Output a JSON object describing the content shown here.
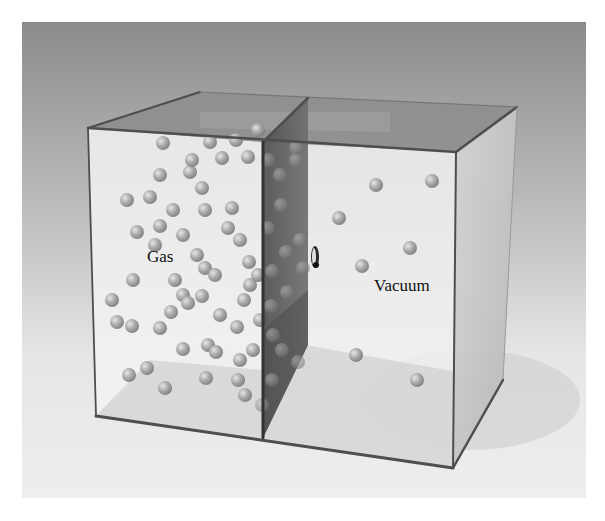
{
  "figure": {
    "labels": {
      "left_chamber": "Gas",
      "right_chamber": "Vacuum"
    },
    "colors": {
      "background_top": "#8c8c8c",
      "background_bottom": "#ededed",
      "particle": "#a8a8a8",
      "partition": "#5e5e5e",
      "glass_edge": "#555555"
    },
    "left_particles": [
      [
        163,
        143
      ],
      [
        127,
        200
      ],
      [
        160,
        175
      ],
      [
        190,
        172
      ],
      [
        202,
        188
      ],
      [
        222,
        158
      ],
      [
        248,
        157
      ],
      [
        192,
        160
      ],
      [
        160,
        226
      ],
      [
        150,
        197
      ],
      [
        137,
        232
      ],
      [
        183,
        235
      ],
      [
        205,
        210
      ],
      [
        232,
        208
      ],
      [
        173,
        210
      ],
      [
        197,
        255
      ],
      [
        205,
        268
      ],
      [
        175,
        280
      ],
      [
        155,
        245
      ],
      [
        240,
        240
      ],
      [
        249,
        262
      ],
      [
        228,
        228
      ],
      [
        215,
        275
      ],
      [
        250,
        285
      ],
      [
        133,
        280
      ],
      [
        183,
        295
      ],
      [
        202,
        296
      ],
      [
        171,
        312
      ],
      [
        132,
        326
      ],
      [
        160,
        328
      ],
      [
        188,
        303
      ],
      [
        220,
        315
      ],
      [
        244,
        300
      ],
      [
        237,
        327
      ],
      [
        253,
        350
      ],
      [
        147,
        368
      ],
      [
        208,
        345
      ],
      [
        216,
        352
      ],
      [
        183,
        349
      ],
      [
        240,
        360
      ],
      [
        129,
        375
      ],
      [
        165,
        388
      ],
      [
        206,
        378
      ],
      [
        238,
        380
      ],
      [
        245,
        395
      ],
      [
        117,
        322
      ],
      [
        112,
        300
      ],
      [
        260,
        320
      ],
      [
        258,
        275
      ],
      [
        210,
        142
      ],
      [
        236,
        140
      ],
      [
        258,
        130
      ]
    ],
    "partition_particles": [
      [
        268,
        160
      ],
      [
        280,
        175
      ],
      [
        296,
        160
      ],
      [
        281,
        205
      ],
      [
        268,
        228
      ],
      [
        300,
        240
      ],
      [
        286,
        252
      ],
      [
        272,
        271
      ],
      [
        303,
        268
      ],
      [
        287,
        292
      ],
      [
        271,
        306
      ],
      [
        298,
        362
      ],
      [
        282,
        350
      ],
      [
        273,
        335
      ],
      [
        262,
        405
      ],
      [
        272,
        380
      ],
      [
        296,
        148
      ]
    ],
    "right_particles": [
      [
        339,
        218
      ],
      [
        376,
        185
      ],
      [
        432,
        181
      ],
      [
        410,
        248
      ],
      [
        362,
        266
      ],
      [
        356,
        355
      ],
      [
        417,
        380
      ]
    ],
    "hole": {
      "x": 315,
      "y": 257
    }
  }
}
